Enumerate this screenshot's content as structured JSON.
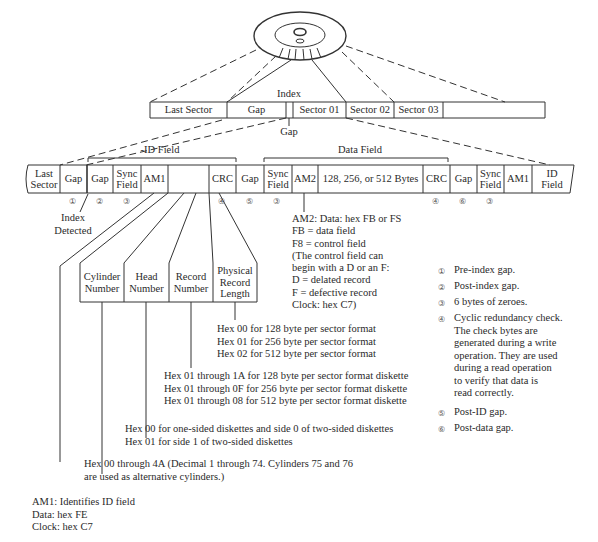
{
  "track": {
    "index_label": "Index",
    "gap_below_label": "Gap",
    "cells": [
      "Last Sector",
      "Gap",
      "",
      "Sector 01",
      "Sector 02",
      "Sector 03"
    ]
  },
  "sector": {
    "id_field_label": "-ID Field",
    "data_field_label": "Data Field",
    "cells": [
      {
        "label": "Last\nSector"
      },
      {
        "label": "Gap",
        "num": "①"
      },
      {
        "label": "Gap",
        "num": "②"
      },
      {
        "label": "Sync\nField",
        "num": "③"
      },
      {
        "label": "AM1"
      },
      {
        "label": ""
      },
      {
        "label": "CRC",
        "num": "④"
      },
      {
        "label": "Gap",
        "num": "⑤"
      },
      {
        "label": "Sync\nField",
        "num": "③"
      },
      {
        "label": "AM2"
      },
      {
        "label": "128, 256, or 512 Bytes"
      },
      {
        "label": "CRC",
        "num": "④"
      },
      {
        "label": "Gap",
        "num": "⑥"
      },
      {
        "label": "Sync\nField",
        "num": "③"
      },
      {
        "label": "AM1"
      },
      {
        "label": "ID\nField"
      }
    ],
    "index_detected": "Index\nDetected"
  },
  "id_subfields": [
    {
      "label": "Cylinder\nNumber"
    },
    {
      "label": "Head\nNumber"
    },
    {
      "label": "Record\nNumber"
    },
    {
      "label": "Physical\nRecord\nLength"
    }
  ],
  "am2_note": "AM2: Data: hex FB or FS\nFB  =  data field\nF8  =  control field\n(The control field can\nbegin with a D or an F:\nD  =  delated record\nF  =  defective record\nClock: hex C7)",
  "record_length_note": "Hex 00 for 128 byte per sector format\nHex 01 for 256 byte per sector format\nHex 02 for 512 byte per sector format",
  "record_number_note": "Hex 01 through 1A for 128 byte per sector format diskette\nHex 01 through 0F for 256 byte per sector format diskette\nHex 01 through 08 for 512 byte per sector format diskette",
  "head_note": "Hex 00 for one-sided diskettes and side 0 of two-sided diskettes\nHex 01 for side 1 of two-sided diskettes",
  "cylinder_note": "Hex 00 through 4A (Decimal 1 through 74. Cylinders 75 and 76\nare used as alternative cylinders.)",
  "am1_note": "AM1: Identifies ID field\nData: hex FE\nClock: hex C7",
  "legend": [
    {
      "num": "①",
      "text": "Pre-index gap."
    },
    {
      "num": "②",
      "text": "Post-index gap."
    },
    {
      "num": "③",
      "text": "6 bytes of zeroes."
    },
    {
      "num": "④",
      "text": "Cyclic redundancy check.\nThe check bytes are\ngenerated during a write\noperation. They are used\nduring a read operation\nto verify that data is\nread correctly."
    },
    {
      "num": "⑤",
      "text": "Post-ID gap."
    },
    {
      "num": "⑥",
      "text": "Post-data gap."
    }
  ]
}
